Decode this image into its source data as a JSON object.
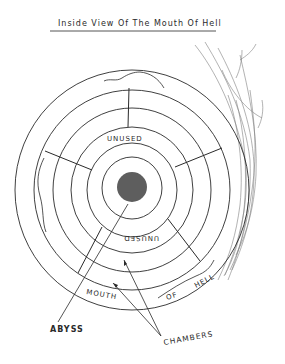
{
  "title": "Inside View Of The Mouth Of Hell",
  "labels": {
    "top_chamber": "UNUSED",
    "bottom_chamber": "UNUSED",
    "outer_ring_1": "MOUTH",
    "outer_ring_2": "OF",
    "outer_ring_3": "HELL",
    "abyss": "ABYSS",
    "chambers": "CHAMBERS"
  },
  "colors": {
    "ink": "#2a2a2a",
    "abyss_fill": "#5e5e5e",
    "background": "#ffffff"
  },
  "geometry": {
    "center": [
      132,
      190
    ],
    "ring_radii": [
      115,
      97,
      79,
      61,
      45,
      30
    ],
    "abyss_radius": 15
  }
}
